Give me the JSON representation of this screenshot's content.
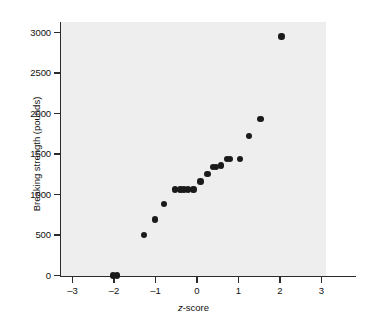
{
  "chart_data": {
    "type": "scatter",
    "title": "",
    "xlabel": "z-score",
    "xlabel_italic_part": "z",
    "xlabel_rest": "-score",
    "ylabel": "Breaking strength (pounds)",
    "xlim": [
      -3.4,
      3.4
    ],
    "ylim": [
      -150,
      3150
    ],
    "xticks": [
      -3,
      -2,
      -1,
      0,
      1,
      2,
      3
    ],
    "xtick_labels": [
      "–3",
      "–2",
      "–1",
      "0",
      "1",
      "2",
      "3"
    ],
    "yticks": [
      0,
      500,
      1000,
      1500,
      2000,
      2500,
      3000
    ],
    "ytick_labels": [
      "0",
      "500",
      "1000",
      "1500",
      "2000",
      "2500",
      "3000"
    ],
    "grid": false,
    "legend": null,
    "point_color": "#1a1a1a",
    "plot_background": "#eeeeee",
    "page_background": "#ffffff",
    "points": [
      {
        "x": -2.02,
        "y": 0
      },
      {
        "x": -1.93,
        "y": 0
      },
      {
        "x": -1.27,
        "y": 500
      },
      {
        "x": -1.01,
        "y": 690
      },
      {
        "x": -0.79,
        "y": 880
      },
      {
        "x": -0.53,
        "y": 1060
      },
      {
        "x": -0.4,
        "y": 1060
      },
      {
        "x": -0.31,
        "y": 1060
      },
      {
        "x": -0.22,
        "y": 1060
      },
      {
        "x": -0.08,
        "y": 1060
      },
      {
        "x": 0.08,
        "y": 1160
      },
      {
        "x": 0.25,
        "y": 1250
      },
      {
        "x": 0.38,
        "y": 1340
      },
      {
        "x": 0.46,
        "y": 1340
      },
      {
        "x": 0.58,
        "y": 1360
      },
      {
        "x": 0.72,
        "y": 1440
      },
      {
        "x": 0.79,
        "y": 1440
      },
      {
        "x": 1.03,
        "y": 1440
      },
      {
        "x": 1.26,
        "y": 1720
      },
      {
        "x": 1.53,
        "y": 1930
      },
      {
        "x": 2.04,
        "y": 2950
      }
    ]
  }
}
